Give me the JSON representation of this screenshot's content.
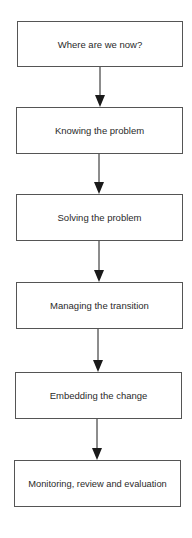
{
  "diagram": {
    "type": "vertical-flowchart",
    "colors": {
      "box_border": "#555555",
      "text": "#2a2a2a",
      "arrow": "#1a1a1a",
      "background": "#ffffff"
    },
    "steps": [
      {
        "label": "Where are we now?"
      },
      {
        "label": "Knowing the problem"
      },
      {
        "label": "Solving the problem"
      },
      {
        "label": "Managing the transition"
      },
      {
        "label": "Embedding the change"
      },
      {
        "label": "Monitoring, review and evaluation"
      }
    ],
    "connectors": [
      {
        "from": 0,
        "to": 1
      },
      {
        "from": 1,
        "to": 2
      },
      {
        "from": 2,
        "to": 3
      },
      {
        "from": 3,
        "to": 4
      },
      {
        "from": 4,
        "to": 5
      }
    ]
  }
}
